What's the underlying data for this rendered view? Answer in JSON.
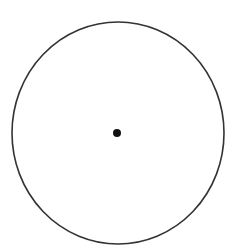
{
  "diagram": {
    "background": "#ffffff",
    "circle": {
      "cx": 118,
      "cy": 133,
      "rx": 106,
      "ry": 111,
      "stroke": "#333333",
      "stroke_width": 1.6,
      "fill": "none"
    },
    "center_point": {
      "cx": 117,
      "cy": 133,
      "r": 4,
      "fill": "#111111"
    }
  }
}
